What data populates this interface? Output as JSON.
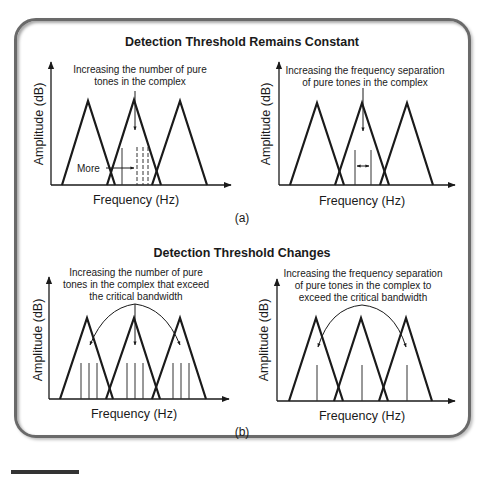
{
  "figure": {
    "panel_a": {
      "title": "Detection Threshold Remains Constant",
      "caption": "(a)",
      "left": {
        "annotation_line1": "Increasing the number of pure",
        "annotation_line2": "tones in the complex",
        "more_label": "More",
        "x_label": "Frequency (Hz)",
        "y_label": "Amplitude (dB)"
      },
      "right": {
        "annotation_line1": "Increasing the frequency separation",
        "annotation_line2": "of pure tones in the complex",
        "x_label": "Frequency (Hz)",
        "y_label": "Amplitude (dB)"
      }
    },
    "panel_b": {
      "title": "Detection Threshold Changes",
      "caption": "(b)",
      "left": {
        "annotation_line1": "Increasing the number of pure",
        "annotation_line2": "tones in the complex that exceed",
        "annotation_line3": "the critical bandwidth",
        "x_label": "Frequency (Hz)",
        "y_label": "Amplitude (dB)"
      },
      "right": {
        "annotation_line1": "Increasing the frequency separation",
        "annotation_line2": "of pure tones in the complex to",
        "annotation_line3": "exceed the critical bandwidth",
        "x_label": "Frequency (Hz)",
        "y_label": "Amplitude (dB)"
      }
    },
    "colors": {
      "stroke": "#1a1a1a",
      "tone_line": "#333333",
      "frame": "#6a6a6a"
    }
  }
}
